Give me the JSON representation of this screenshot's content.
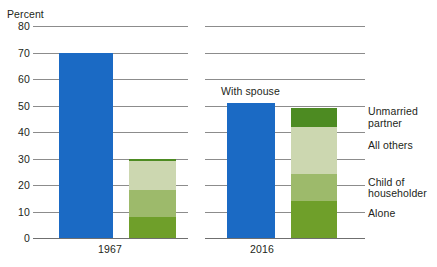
{
  "chart_data": {
    "type": "bar",
    "subtype": "grouped-stacked-bar",
    "title": "",
    "xlabel": "",
    "ylabel": "Percent",
    "ylim": [
      0,
      80
    ],
    "yticks": [
      0,
      10,
      20,
      30,
      40,
      50,
      60,
      70,
      80
    ],
    "ytick_labels": [
      "0",
      "10",
      "20",
      "30",
      "40",
      "50",
      "60",
      "70",
      "80"
    ],
    "grid": true,
    "legend_position": "right",
    "categories": [
      "1967",
      "2016"
    ],
    "panels": [
      {
        "label": "1967",
        "bars": [
          {
            "name": "With spouse",
            "stacked": false,
            "total": 70,
            "segments": [
              {
                "name": "With spouse",
                "value": 70,
                "color": "#1b6ac4"
              }
            ]
          },
          {
            "name": "Other arrangements",
            "stacked": true,
            "total": 30,
            "segments": [
              {
                "name": "Alone",
                "value": 8,
                "color": "#6f9f2a"
              },
              {
                "name": "Child of householder",
                "value": 10,
                "color": "#9dba6b"
              },
              {
                "name": "All others",
                "value": 11,
                "color": "#ccd7b0"
              },
              {
                "name": "Unmarried partner",
                "value": 1,
                "color": "#4d8b22"
              }
            ]
          }
        ]
      },
      {
        "label": "2016",
        "bars": [
          {
            "name": "With spouse",
            "stacked": false,
            "total": 51,
            "segments": [
              {
                "name": "With spouse",
                "value": 51,
                "color": "#1b6ac4"
              }
            ]
          },
          {
            "name": "Other arrangements",
            "stacked": true,
            "total": 49,
            "segments": [
              {
                "name": "Alone",
                "value": 14,
                "color": "#6f9f2a"
              },
              {
                "name": "Child of householder",
                "value": 10,
                "color": "#9dba6b"
              },
              {
                "name": "All others",
                "value": 18,
                "color": "#ccd7b0"
              },
              {
                "name": "Unmarried partner",
                "value": 7,
                "color": "#4d8b22"
              }
            ]
          }
        ]
      }
    ],
    "series_annotation": "With spouse",
    "legend": [
      {
        "label": "Unmarried\npartner",
        "color": "#4d8b22",
        "at_value": 45.5
      },
      {
        "label": "All others",
        "color": "#ccd7b0",
        "at_value": 33
      },
      {
        "label": "Child of\nhouseholder",
        "color": "#9dba6b",
        "at_value": 19
      },
      {
        "label": "Alone",
        "color": "#6f9f2a",
        "at_value": 7
      }
    ]
  },
  "colors": {
    "with_spouse_blue": "#1b6ac4",
    "alone_green": "#6f9f2a",
    "child_green": "#9dba6b",
    "all_others_green": "#ccd7b0",
    "unmarried_green": "#4d8b22",
    "gridline": "#8c8c8c",
    "text": "#231f20"
  }
}
